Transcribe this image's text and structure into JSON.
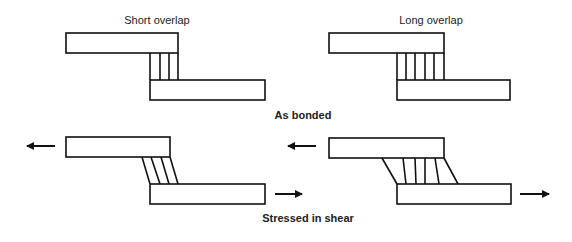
{
  "labels": {
    "short_overlap": "Short overlap",
    "long_overlap": "Long overlap",
    "as_bonded": "As bonded",
    "stressed_in_shear": "Stressed in shear"
  },
  "colors": {
    "stroke": "#111111",
    "background": "#ffffff"
  },
  "panels": [
    {
      "name": "short-overlap-as-bonded",
      "adhesive_lines": 4,
      "state": "unstressed"
    },
    {
      "name": "long-overlap-as-bonded",
      "adhesive_lines": 6,
      "state": "unstressed"
    },
    {
      "name": "short-overlap-stressed",
      "adhesive_lines": 4,
      "state": "shear"
    },
    {
      "name": "long-overlap-stressed",
      "adhesive_lines": 6,
      "state": "shear"
    }
  ]
}
